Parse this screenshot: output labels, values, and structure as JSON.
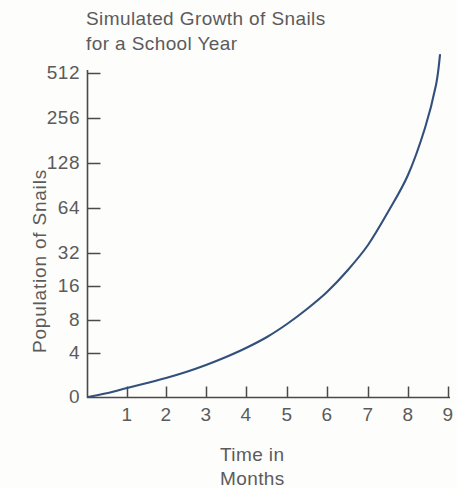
{
  "chart_data": {
    "type": "line",
    "title": "Simulated Growth of Snails\nfor a School Year",
    "title_line1": "Simulated Growth of Snails",
    "title_line2": "for a School Year",
    "xlabel": "Time in\nMonths",
    "xlabel_line1": "Time in",
    "xlabel_line2": "Months",
    "ylabel": "Population of Snails",
    "yscale": "log2",
    "grid": false,
    "legend": null,
    "x_ticks": [
      1,
      2,
      3,
      4,
      5,
      6,
      7,
      8,
      9
    ],
    "x_tick_labels": [
      "1",
      "2",
      "3",
      "4",
      "5",
      "6",
      "7",
      "8",
      "9"
    ],
    "y_ticks": [
      0,
      4,
      8,
      16,
      32,
      64,
      128,
      256,
      512
    ],
    "y_tick_labels": [
      "0",
      "4",
      "8",
      "16",
      "32",
      "64",
      "128",
      "256",
      "512"
    ],
    "xlim": [
      0,
      9.1
    ],
    "ylim": [
      0,
      700
    ],
    "series": [
      {
        "name": "Snail population",
        "color": "#33507d",
        "x": [
          0,
          0.5,
          1,
          1.5,
          2,
          2.5,
          3,
          3.5,
          4,
          4.5,
          5,
          5.5,
          6,
          6.5,
          7,
          7.5,
          8,
          8.5,
          8.8,
          9.0
        ],
        "values": [
          0,
          0.8,
          1.6,
          2.3,
          3.0,
          3.9,
          5.0,
          6.4,
          8.2,
          11,
          15,
          20,
          28,
          38,
          54,
          78,
          118,
          200,
          380,
          690
        ]
      }
    ],
    "curve_points_px": [
      [
        88,
        397
      ],
      [
        108,
        393
      ],
      [
        127,
        388
      ],
      [
        147,
        383
      ],
      [
        166,
        378
      ],
      [
        186,
        372
      ],
      [
        206,
        365
      ],
      [
        226,
        357
      ],
      [
        246,
        348
      ],
      [
        267,
        337
      ],
      [
        287,
        324
      ],
      [
        307,
        309
      ],
      [
        327,
        292
      ],
      [
        347,
        271
      ],
      [
        368,
        245
      ],
      [
        388,
        212
      ],
      [
        408,
        175
      ],
      [
        425,
        128
      ],
      [
        436,
        85
      ],
      [
        440,
        55
      ]
    ]
  },
  "axis": {
    "y_axis_name": "y-axis",
    "x_axis_name": "x-axis",
    "axis_color": "#4a4a4a",
    "line_color": "#33507d",
    "background": "#fdfdfb"
  }
}
